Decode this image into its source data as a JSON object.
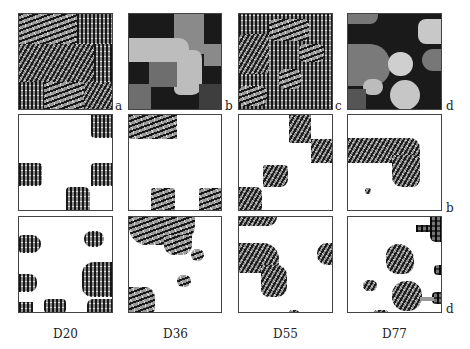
{
  "figure": {
    "columns": [
      "D20",
      "D36",
      "D55",
      "D77"
    ],
    "row_labels": {
      "row1": [
        "a",
        "b",
        "c",
        "d"
      ],
      "row2_right": "b",
      "row3_right": "d"
    },
    "rows": [
      {
        "name": "input-mosaic-and-segmentation",
        "panels": [
          "texture mosaic",
          "segmentation map",
          "texture mosaic",
          "segmentation map"
        ]
      },
      {
        "name": "extracted-texture-result-b",
        "panels": [
          "D20 extracted",
          "D36 extracted",
          "D55 extracted",
          "D77 extracted"
        ]
      },
      {
        "name": "extracted-texture-result-d",
        "panels": [
          "D20 extracted",
          "D36 extracted",
          "D55 extracted",
          "D77 extracted"
        ]
      }
    ]
  }
}
